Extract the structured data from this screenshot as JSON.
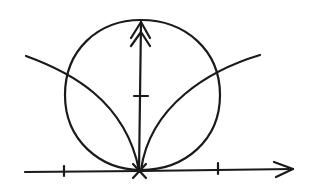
{
  "diagram": {
    "ink_color": "#1a1a1a",
    "background": "#ffffff",
    "origin": [
      139,
      170
    ],
    "x_axis": {
      "from": [
        25,
        172
      ],
      "to": [
        293,
        169
      ],
      "ticks": [
        64,
        218
      ]
    },
    "y_axis": {
      "from": [
        139,
        172
      ],
      "to": [
        141,
        22
      ],
      "ticks": [
        96
      ]
    },
    "circle": {
      "cx": 142,
      "cy": 95,
      "r": 77
    },
    "cusp_curve": {
      "left_end": [
        26,
        56
      ],
      "right_end": [
        260,
        55
      ]
    }
  }
}
